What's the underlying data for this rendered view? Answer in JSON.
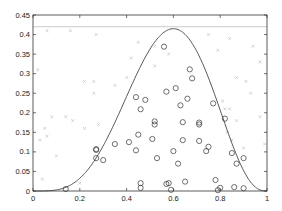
{
  "chart_data": {
    "type": "scatter",
    "title": "",
    "xlabel": "",
    "ylabel": "",
    "xlim": [
      0,
      1
    ],
    "ylim": [
      0,
      0.45
    ],
    "grid": false,
    "legend": null,
    "x_ticks": [
      0,
      0.2,
      0.4,
      0.6,
      0.8,
      1
    ],
    "x_tick_labels": [
      "0",
      "0.2",
      "0.4",
      "0.6",
      "0.8",
      "1"
    ],
    "y_ticks": [
      0,
      0.05,
      0.1,
      0.15,
      0.2,
      0.25,
      0.3,
      0.35,
      0.4,
      0.45
    ],
    "y_tick_labels": [
      "0",
      "0.05",
      "0.1",
      "0.15",
      "0.2",
      "0.25",
      "0.3",
      "0.35",
      "0.4",
      "0.45"
    ],
    "series": [
      {
        "name": "target-density-curve",
        "kind": "line",
        "color": "#444444",
        "description": "Bell-shaped density, zero at x=0 and x=1, peak ~0.415 at x~0.6",
        "peak": {
          "x": 0.6,
          "y": 0.415
        }
      },
      {
        "name": "envelope-line",
        "kind": "hline",
        "color": "#cccccc",
        "y": 0.42
      },
      {
        "name": "accepted-samples",
        "kind": "scatter",
        "marker": "circle",
        "color": "#333333",
        "points": [
          [
            0.14,
            0.005
          ],
          [
            0.27,
            0.107
          ],
          [
            0.27,
            0.105
          ],
          [
            0.27,
            0.084
          ],
          [
            0.3,
            0.079
          ],
          [
            0.35,
            0.12
          ],
          [
            0.41,
            0.125
          ],
          [
            0.44,
            0.104
          ],
          [
            0.45,
            0.144
          ],
          [
            0.44,
            0.24
          ],
          [
            0.46,
            0.209
          ],
          [
            0.46,
            0.02
          ],
          [
            0.46,
            0.008
          ],
          [
            0.48,
            0.233
          ],
          [
            0.52,
            0.178
          ],
          [
            0.51,
            0.133
          ],
          [
            0.53,
            0.084
          ],
          [
            0.52,
            0.17
          ],
          [
            0.56,
            0.369
          ],
          [
            0.57,
            0.254
          ],
          [
            0.57,
            0.018
          ],
          [
            0.58,
            0.02
          ],
          [
            0.59,
            0.003
          ],
          [
            0.61,
            0.263
          ],
          [
            0.6,
            0.102
          ],
          [
            0.62,
            0.07
          ],
          [
            0.63,
            0.219
          ],
          [
            0.64,
            0.13
          ],
          [
            0.65,
            0.024
          ],
          [
            0.64,
            0.176
          ],
          [
            0.67,
            0.311
          ],
          [
            0.66,
            0.236
          ],
          [
            0.68,
            0.288
          ],
          [
            0.71,
            0.175
          ],
          [
            0.71,
            0.17
          ],
          [
            0.71,
            0.128
          ],
          [
            0.74,
            0.102
          ],
          [
            0.75,
            0.113
          ],
          [
            0.77,
            0.224
          ],
          [
            0.79,
            0.002
          ],
          [
            0.78,
            0.028
          ],
          [
            0.8,
            0.008
          ],
          [
            0.82,
            0.185
          ],
          [
            0.85,
            0.097
          ],
          [
            0.86,
            0.01
          ],
          [
            0.87,
            0.07
          ],
          [
            0.9,
            0.007
          ],
          [
            0.9,
            0.084
          ]
        ]
      },
      {
        "name": "rejected-samples",
        "kind": "scatter",
        "marker": "x",
        "color": "#c8c8c8",
        "points": [
          [
            0.02,
            0.31
          ],
          [
            0.06,
            0.41
          ],
          [
            0.16,
            0.41
          ],
          [
            0.27,
            0.4
          ],
          [
            0.22,
            0.28
          ],
          [
            0.26,
            0.28
          ],
          [
            0.26,
            0.25
          ],
          [
            0.35,
            0.27
          ],
          [
            0.42,
            0.34
          ],
          [
            0.45,
            0.38
          ],
          [
            0.4,
            0.29
          ],
          [
            0.52,
            0.37
          ],
          [
            0.52,
            0.32
          ],
          [
            0.58,
            0.35
          ],
          [
            0.08,
            0.19
          ],
          [
            0.14,
            0.19
          ],
          [
            0.17,
            0.18
          ],
          [
            0.22,
            0.16
          ],
          [
            0.28,
            0.17
          ],
          [
            0.03,
            0.13
          ],
          [
            0.05,
            0.16
          ],
          [
            0.06,
            0.14
          ],
          [
            0.1,
            0.09
          ],
          [
            0.04,
            0.03
          ],
          [
            0.2,
            0.02
          ],
          [
            0.75,
            0.4
          ],
          [
            0.79,
            0.36
          ],
          [
            0.84,
            0.39
          ],
          [
            0.94,
            0.37
          ],
          [
            0.87,
            0.29
          ],
          [
            0.91,
            0.28
          ],
          [
            0.93,
            0.25
          ],
          [
            0.81,
            0.23
          ],
          [
            0.82,
            0.21
          ],
          [
            0.84,
            0.21
          ],
          [
            0.87,
            0.18
          ],
          [
            0.83,
            0.15
          ],
          [
            0.85,
            0.13
          ],
          [
            0.9,
            0.11
          ],
          [
            0.97,
            0.33
          ],
          [
            0.97,
            0.19
          ],
          [
            0.99,
            0.12
          ]
        ]
      }
    ]
  }
}
